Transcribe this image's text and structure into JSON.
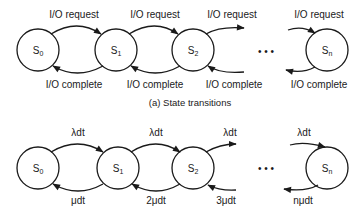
{
  "diagram_a": {
    "caption": "(a)  State transitions",
    "states": [
      {
        "id": "S0",
        "base": "S",
        "sub": "0"
      },
      {
        "id": "S1",
        "base": "S",
        "sub": "1"
      },
      {
        "id": "S2",
        "base": "S",
        "sub": "2"
      },
      {
        "id": "Sn",
        "base": "S",
        "sub": "n"
      }
    ],
    "forward_labels": [
      "I/O request",
      "I/O request",
      "I/O request",
      "I/O request"
    ],
    "backward_labels": [
      "I/O complete",
      "I/O complete",
      "I/O complete",
      "I/O complete"
    ],
    "ellipsis": "• • •"
  },
  "diagram_b": {
    "states": [
      {
        "id": "S0",
        "base": "S",
        "sub": "0"
      },
      {
        "id": "S1",
        "base": "S",
        "sub": "1"
      },
      {
        "id": "S2",
        "base": "S",
        "sub": "2"
      },
      {
        "id": "Sn",
        "base": "S",
        "sub": "n"
      }
    ],
    "forward_labels": [
      "λdt",
      "λdt",
      "λdt",
      "λdt"
    ],
    "backward_labels": [
      "μdt",
      "2μdt",
      "3μdt",
      "nμdt"
    ],
    "ellipsis": "• • •"
  }
}
